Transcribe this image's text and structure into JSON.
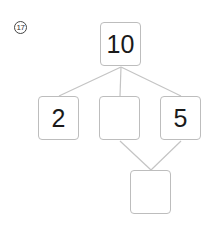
{
  "problem": {
    "number": "17",
    "diagram": {
      "type": "number-bond-tree",
      "root": {
        "id": "top",
        "value": "10"
      },
      "children": [
        {
          "id": "left",
          "value": "2"
        },
        {
          "id": "middle",
          "value": ""
        },
        {
          "id": "right",
          "value": "5"
        }
      ],
      "bottom": {
        "id": "bottom",
        "value": "",
        "parents": [
          "middle",
          "right"
        ]
      }
    },
    "colors": {
      "box_border": "#bdbdbd",
      "line": "#c4c4c4",
      "text": "#1a1a1a"
    }
  }
}
